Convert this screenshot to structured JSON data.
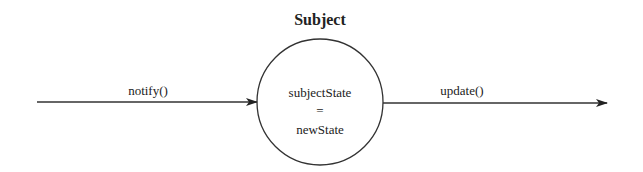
{
  "diagram": {
    "title": "Subject",
    "node": {
      "line1": "subjectState",
      "line2": "=",
      "line3": "newState"
    },
    "incoming": {
      "label": "notify()"
    },
    "outgoing": {
      "label": "update()"
    },
    "colors": {
      "stroke": "#333333",
      "text": "#222222",
      "background": "#ffffff"
    }
  }
}
